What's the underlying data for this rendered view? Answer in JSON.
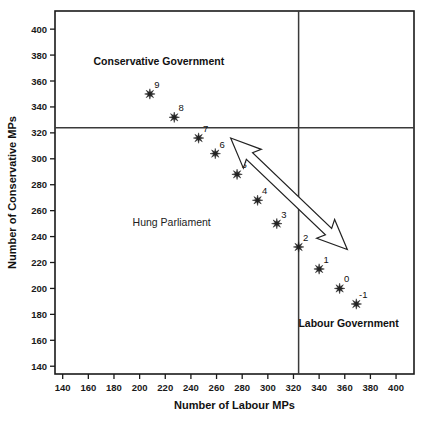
{
  "chart_data": {
    "type": "scatter",
    "title": "",
    "xlabel": "Number of Labour MPs",
    "ylabel": "Number of Conservative MPs",
    "xlim": [
      134,
      414
    ],
    "ylim": [
      134,
      414
    ],
    "xticks": [
      140,
      160,
      180,
      200,
      220,
      240,
      260,
      280,
      300,
      320,
      340,
      360,
      380,
      400
    ],
    "yticks": [
      140,
      160,
      180,
      200,
      220,
      240,
      260,
      280,
      300,
      320,
      340,
      360,
      380,
      400
    ],
    "grid": false,
    "legend": "none",
    "reference_lines": {
      "vertical_x": 324,
      "horizontal_y": 324,
      "note": "Majority threshold lines at 324 seats"
    },
    "marker": "star",
    "point_labels": [
      "9",
      "8",
      "7",
      "6",
      "5",
      "4",
      "3",
      "2",
      "1",
      "0",
      "-1"
    ],
    "points": [
      {
        "label": "9",
        "x": 208,
        "y": 350
      },
      {
        "label": "8",
        "x": 227,
        "y": 332
      },
      {
        "label": "7",
        "x": 246,
        "y": 316
      },
      {
        "label": "6",
        "x": 259,
        "y": 304
      },
      {
        "label": "5",
        "x": 276,
        "y": 288
      },
      {
        "label": "4",
        "x": 292,
        "y": 268
      },
      {
        "label": "3",
        "x": 307,
        "y": 250
      },
      {
        "label": "2",
        "x": 324,
        "y": 232
      },
      {
        "label": "1",
        "x": 340,
        "y": 215
      },
      {
        "label": "0",
        "x": 356,
        "y": 200
      },
      {
        "label": "-1",
        "x": 369,
        "y": 188
      }
    ],
    "annotations": [
      {
        "name": "conservative-government",
        "text": "Conservative Government",
        "x": 215,
        "y": 372,
        "bold": true
      },
      {
        "name": "hung-parliament",
        "text": "Hung Parliament",
        "x": 225,
        "y": 248,
        "bold": false
      },
      {
        "name": "labour-government",
        "text": "Labour Government",
        "x": 363,
        "y": 170,
        "bold": true
      }
    ],
    "arrow": {
      "name": "swing-arrow",
      "double_headed": true,
      "from": {
        "x": 271,
        "y": 316
      },
      "to": {
        "x": 362,
        "y": 230
      },
      "fill": "#ffffff",
      "stroke": "#222222"
    },
    "colors": {
      "marker": "#222222",
      "axis": "#1a1a1a",
      "reference_line": "#3a3a3a",
      "background": "#ffffff",
      "text": "#111111"
    }
  }
}
